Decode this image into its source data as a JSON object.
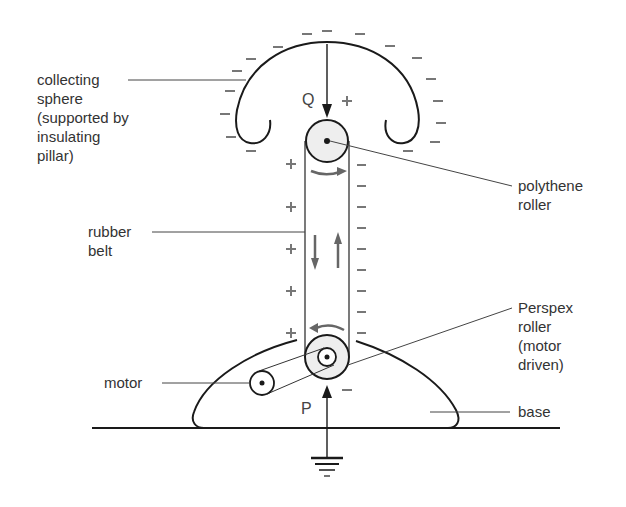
{
  "colors": {
    "outline": "#1a1a1a",
    "charge": "#777777",
    "leader": "#444444",
    "roller_fill": "#eeeeee",
    "arrow": "#666666"
  },
  "labels": {
    "collecting_sphere": "collecting\nsphere\n(supported by\ninsulating\npillar)",
    "rubber_belt": "rubber\nbelt",
    "motor": "motor",
    "polythene_roller": "polythene\nroller",
    "perspex_roller": "Perspex\nroller\n(motor\ndriven)",
    "base": "base",
    "point_q": "Q",
    "point_p": "P"
  },
  "charges": {
    "sphere_outer": "−",
    "sphere_inner": "+",
    "belt_left": "+",
    "belt_right": "−",
    "base_top_left": "+",
    "below_perspex": "−"
  },
  "components": [
    {
      "name": "collecting sphere",
      "charge": "negative outside"
    },
    {
      "name": "polythene roller",
      "position": "top"
    },
    {
      "name": "rubber belt",
      "charge_left": "positive",
      "charge_right": "negative"
    },
    {
      "name": "Perspex roller",
      "position": "bottom",
      "driven_by": "motor"
    },
    {
      "name": "motor"
    },
    {
      "name": "base"
    },
    {
      "name": "earth connection"
    }
  ]
}
